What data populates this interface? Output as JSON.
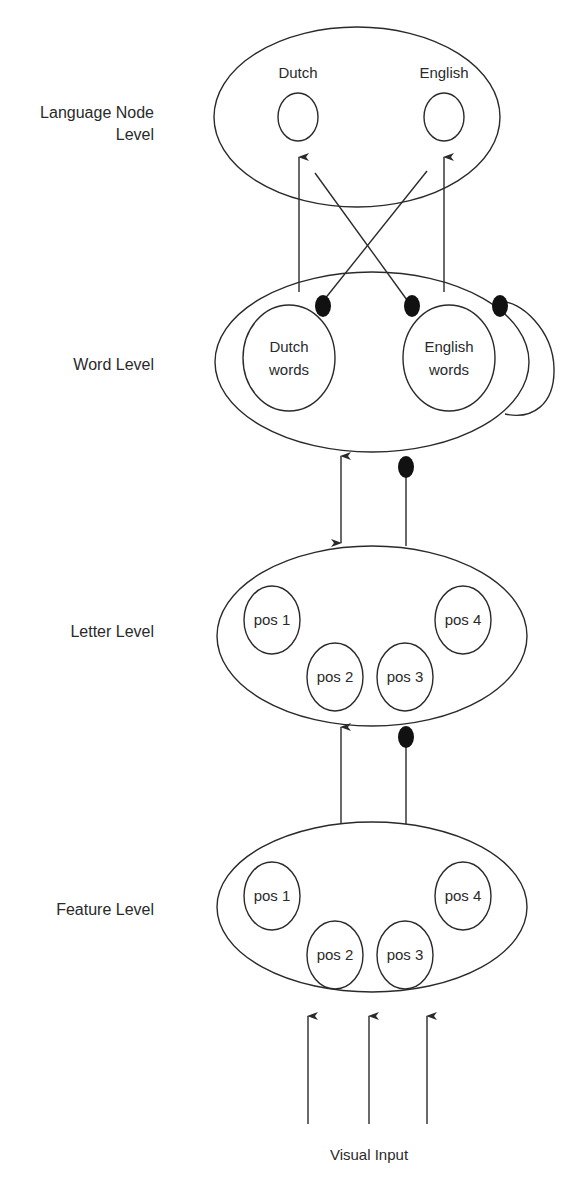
{
  "levels": {
    "language": {
      "label_line1": "Language Node",
      "label_line2": "Level",
      "nodes": [
        "Dutch",
        "English"
      ]
    },
    "word": {
      "label": "Word Level",
      "nodes": [
        {
          "line1": "Dutch",
          "line2": "words"
        },
        {
          "line1": "English",
          "line2": "words"
        }
      ]
    },
    "letter": {
      "label": "Letter Level",
      "nodes": [
        "pos 1",
        "pos 2",
        "pos 3",
        "pos 4"
      ]
    },
    "feature": {
      "label": "Feature Level",
      "nodes": [
        "pos 1",
        "pos 2",
        "pos 3",
        "pos 4"
      ]
    }
  },
  "input": {
    "label": "Visual Input"
  },
  "legend_semantics": {
    "arrow": "excitatory connection",
    "filled_dot": "inhibitory connection"
  }
}
